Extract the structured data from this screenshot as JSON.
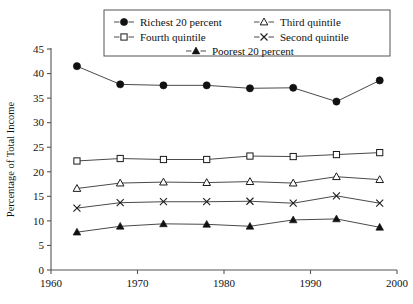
{
  "chart_data": {
    "type": "line",
    "title": "",
    "xlabel": "",
    "ylabel": "Percentage of Total Income",
    "xlim": [
      1960,
      2000
    ],
    "ylim": [
      0,
      45
    ],
    "xticks": [
      1960,
      1970,
      1980,
      1990,
      2000
    ],
    "yticks": [
      0,
      5,
      10,
      15,
      20,
      25,
      30,
      35,
      40,
      45
    ],
    "grid": false,
    "legend_position": "top-center-overlay",
    "x": [
      1963,
      1968,
      1973,
      1978,
      1983,
      1988,
      1993,
      1998
    ],
    "series": [
      {
        "name": "Richest 20 percent",
        "marker": "filled-circle",
        "values": [
          41.5,
          37.8,
          37.6,
          37.6,
          37.0,
          37.1,
          34.3,
          38.6
        ]
      },
      {
        "name": "Fourth quintile",
        "marker": "open-square",
        "values": [
          22.2,
          22.7,
          22.5,
          22.5,
          23.2,
          23.1,
          23.5,
          23.9
        ]
      },
      {
        "name": "Third quintile",
        "marker": "open-triangle",
        "values": [
          16.6,
          17.7,
          17.9,
          17.8,
          18.0,
          17.7,
          19.0,
          18.4
        ]
      },
      {
        "name": "Second quintile",
        "marker": "cross-x",
        "values": [
          12.6,
          13.7,
          13.9,
          13.9,
          14.0,
          13.6,
          15.1,
          13.6
        ]
      },
      {
        "name": "Poorest 20 percent",
        "marker": "filled-triangle",
        "values": [
          7.7,
          8.9,
          9.4,
          9.3,
          8.9,
          10.2,
          10.4,
          8.7
        ]
      }
    ]
  },
  "legend": {
    "entries": [
      {
        "label": "Richest 20 percent"
      },
      {
        "label": "Third quintile"
      },
      {
        "label": "Fourth quintile"
      },
      {
        "label": "Second quintile"
      },
      {
        "label": "Poorest 20 percent"
      }
    ]
  },
  "axes": {
    "y_title": "Percentage of Total Income",
    "y_tick_labels": [
      "45",
      "40",
      "35",
      "30",
      "25",
      "20",
      "15",
      "10",
      "5",
      "0"
    ],
    "x_tick_labels": [
      "1960",
      "1970",
      "1980",
      "1990",
      "2000"
    ]
  },
  "colors": {
    "ink": "#111111",
    "axis": "#555555",
    "line": "#4a4a4a",
    "background": "#ffffff"
  }
}
